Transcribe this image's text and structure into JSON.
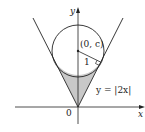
{
  "diagram": {
    "axis_labels": {
      "x": "x",
      "y": "y"
    },
    "origin_label": "0",
    "center_label": "(0, c)",
    "radius_label": "1",
    "curve_label": "y = |2x|",
    "colors": {
      "stroke": "#222222",
      "shade": "#c8c8c8",
      "background": "#ffffff"
    }
  }
}
